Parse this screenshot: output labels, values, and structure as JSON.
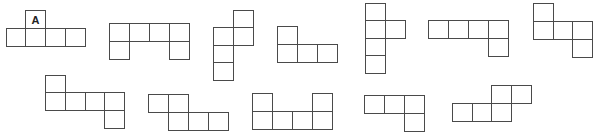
{
  "diagram": {
    "title": "",
    "cell_size": 20,
    "line_color": "#4a4a4a",
    "nets": [
      {
        "id": "net-1",
        "label_cell": {
          "index": 0,
          "text": "A"
        },
        "cells": [
          [
            25,
            10
          ],
          [
            6,
            28
          ],
          [
            25,
            28
          ],
          [
            45,
            28
          ],
          [
            65,
            28
          ]
        ]
      },
      {
        "id": "net-2",
        "cells": [
          [
            109,
            23
          ],
          [
            129,
            23
          ],
          [
            149,
            23
          ],
          [
            169,
            23
          ],
          [
            109,
            41
          ],
          [
            169,
            41
          ]
        ]
      },
      {
        "id": "net-3",
        "cells": [
          [
            233,
            10
          ],
          [
            213,
            27
          ],
          [
            233,
            27
          ],
          [
            213,
            45
          ],
          [
            213,
            62
          ]
        ]
      },
      {
        "id": "net-4",
        "cells": [
          [
            277,
            26
          ],
          [
            277,
            44
          ],
          [
            297,
            44
          ],
          [
            317,
            44
          ]
        ]
      },
      {
        "id": "net-5",
        "cells": [
          [
            365,
            3
          ],
          [
            365,
            20
          ],
          [
            385,
            20
          ],
          [
            365,
            38
          ],
          [
            365,
            55
          ]
        ]
      },
      {
        "id": "net-6",
        "cells": [
          [
            428,
            20
          ],
          [
            448,
            20
          ],
          [
            468,
            20
          ],
          [
            488,
            20
          ],
          [
            488,
            38
          ]
        ]
      },
      {
        "id": "net-7",
        "cells": [
          [
            533,
            3
          ],
          [
            533,
            21
          ],
          [
            553,
            21
          ],
          [
            572,
            21
          ],
          [
            572,
            39
          ]
        ]
      },
      {
        "id": "net-8",
        "cells": [
          [
            45,
            75
          ],
          [
            45,
            92
          ],
          [
            65,
            92
          ],
          [
            85,
            92
          ],
          [
            104,
            92
          ],
          [
            104,
            110
          ]
        ]
      },
      {
        "id": "net-9",
        "cells": [
          [
            148,
            94
          ],
          [
            168,
            94
          ],
          [
            168,
            112
          ],
          [
            188,
            112
          ],
          [
            208,
            112
          ]
        ]
      },
      {
        "id": "net-10",
        "cells": [
          [
            252,
            93
          ],
          [
            312,
            93
          ],
          [
            252,
            111
          ],
          [
            272,
            111
          ],
          [
            292,
            111
          ],
          [
            312,
            111
          ]
        ]
      },
      {
        "id": "net-11",
        "cells": [
          [
            364,
            95
          ],
          [
            384,
            95
          ],
          [
            404,
            95
          ],
          [
            404,
            113
          ]
        ]
      },
      {
        "id": "net-12",
        "cells": [
          [
            491,
            85
          ],
          [
            511,
            85
          ],
          [
            452,
            103
          ],
          [
            472,
            103
          ],
          [
            491,
            103
          ]
        ]
      }
    ]
  }
}
